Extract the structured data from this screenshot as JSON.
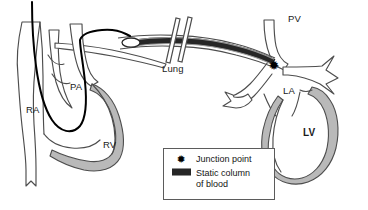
{
  "figure": {
    "background_color": "#ffffff",
    "outline_color": "#4d4d4d",
    "myocardium_fill": "#b9b9b9",
    "catheter_color": "#000000",
    "static_column_color": "#262626",
    "static_column_edge_color": "#8e8e8e"
  },
  "labels": {
    "ra": "RA",
    "pa": "PA",
    "rv": "RV",
    "lung": "Lung",
    "pv": "PV",
    "la": "LA",
    "lv": "LV"
  },
  "markers": {
    "junction_star": "✹"
  },
  "legend": {
    "items": [
      {
        "symbol": "star",
        "glyph": "✹",
        "label": "Junction point"
      },
      {
        "symbol": "bar",
        "label_line1": "Static column",
        "label_line2": "of blood"
      }
    ]
  }
}
